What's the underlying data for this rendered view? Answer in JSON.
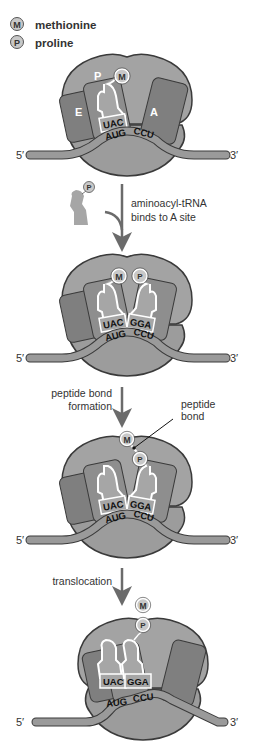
{
  "legend": {
    "items": [
      {
        "symbol": "M",
        "label": "methionine"
      },
      {
        "symbol": "P",
        "label": "proline"
      }
    ]
  },
  "colors": {
    "ribosome_large": "#a3a3a3",
    "ribosome_small": "#9c9c9c",
    "site_dark": "#7f7f7f",
    "outline": "#3a3a3a",
    "mrna": "#9a9a9a",
    "trna": "#a6a6a6",
    "amino_acid": "#c8c8c8"
  },
  "steps": [
    {
      "id": "initial",
      "sites": {
        "e": "E",
        "p": "P",
        "a": "A"
      },
      "codons": [
        "AUG",
        "CCU"
      ],
      "anticodons": [
        "UAC"
      ],
      "amino_acids": [
        "M"
      ],
      "mrna_ends": {
        "five": "5′",
        "three": "3′"
      }
    },
    {
      "id": "a-site-bound",
      "codons": [
        "AUG",
        "CCU"
      ],
      "anticodons": [
        "UAC",
        "GGA"
      ],
      "amino_acids": [
        "M",
        "P"
      ],
      "mrna_ends": {
        "five": "5′",
        "three": "3′"
      }
    },
    {
      "id": "peptide-formed",
      "codons": [
        "AUG",
        "CCU"
      ],
      "anticodons": [
        "UAC",
        "GGA"
      ],
      "amino_acids": [
        "M",
        "P"
      ],
      "annotation": [
        "peptide",
        "bond"
      ],
      "mrna_ends": {
        "five": "5′",
        "three": "3′"
      }
    },
    {
      "id": "translocated",
      "codons": [
        "AUG",
        "CCU"
      ],
      "anticodons": [
        "UAC",
        "GGA"
      ],
      "amino_acids": [
        "M",
        "P"
      ],
      "mrna_ends": {
        "five": "5′",
        "three": "3′"
      }
    }
  ],
  "free_trna": {
    "amino_acid": "P"
  },
  "transitions": [
    {
      "lines": [
        "aminoacyl-tRNA",
        "binds to A site"
      ]
    },
    {
      "lines": [
        "peptide bond",
        "formation"
      ]
    },
    {
      "lines": [
        "translocation"
      ]
    }
  ]
}
